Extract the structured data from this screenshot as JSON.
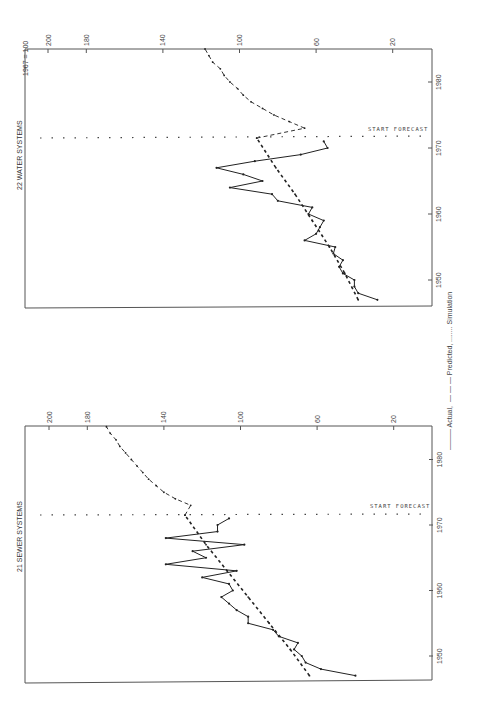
{
  "legend": {
    "actual_label": "——— Actual,",
    "predicted_label": "— — — Predicted,",
    "simulation_label": "........ Simulation"
  },
  "chart_data": [
    {
      "type": "line",
      "title": "22 WATER SYSTEMS",
      "subtitle": "1967 = 100",
      "xlabel": "Year",
      "ylabel": "Index (1967 = 100)",
      "x_ticks": [
        1950,
        1960,
        1970,
        1980
      ],
      "y_ticks": [
        20,
        60,
        100,
        140,
        180,
        200
      ],
      "xlim": [
        1946.5,
        1985
      ],
      "ylim": [
        0,
        210
      ],
      "annotation": "START FORECAST",
      "forecast_start_year": 1971.5,
      "rotation": "rotated 90 degrees counter-clockwise",
      "series": [
        {
          "name": "Actual",
          "style": "solid",
          "x": [
            1947,
            1948,
            1949,
            1950,
            1951,
            1952,
            1953,
            1954,
            1955,
            1956,
            1957,
            1958,
            1959,
            1960,
            1961,
            1962,
            1963,
            1964,
            1965,
            1966,
            1967,
            1968,
            1969,
            1970,
            1971
          ],
          "values": [
            28,
            38,
            40,
            40,
            46,
            48,
            46,
            51,
            50,
            66,
            60,
            58,
            56,
            64,
            62,
            80,
            83,
            105,
            88,
            98,
            112,
            92,
            68,
            54,
            56
          ]
        },
        {
          "name": "Predicted",
          "style": "dashed",
          "x": [
            1947,
            1951,
            1955,
            1959,
            1963,
            1967,
            1971.5
          ],
          "values": [
            38,
            45,
            53,
            62,
            71,
            81,
            91
          ]
        },
        {
          "name": "Simulation",
          "style": "dotted",
          "x": [
            1971.5,
            1973,
            1974,
            1975,
            1976,
            1977,
            1978,
            1979,
            1980,
            1981,
            1982,
            1983,
            1984,
            1985
          ],
          "values": [
            91,
            66,
            74,
            82,
            88,
            94,
            98,
            101,
            105,
            108,
            110,
            114,
            116,
            118
          ]
        }
      ]
    },
    {
      "type": "line",
      "title": "21 SEWER SYSTEMS",
      "subtitle": "",
      "xlabel": "Year",
      "ylabel": "Index (1967 = 100)",
      "x_ticks": [
        1950,
        1960,
        1970,
        1980
      ],
      "y_ticks": [
        20,
        60,
        100,
        140,
        180,
        200
      ],
      "xlim": [
        1946.5,
        1985
      ],
      "ylim": [
        0,
        210
      ],
      "annotation": "START FORECAST",
      "forecast_start_year": 1971.5,
      "rotation": "rotated 90 degrees counter-clockwise",
      "series": [
        {
          "name": "Actual",
          "style": "solid",
          "x": [
            1947,
            1948,
            1949,
            1950,
            1951,
            1952,
            1953,
            1954,
            1955,
            1956,
            1957,
            1958,
            1959,
            1960,
            1961,
            1962,
            1963,
            1964,
            1965,
            1966,
            1967,
            1968,
            1969,
            1970,
            1971
          ],
          "values": [
            40,
            58,
            66,
            68,
            72,
            70,
            80,
            83,
            96,
            96,
            102,
            106,
            110,
            104,
            106,
            120,
            102,
            139,
            118,
            125,
            98,
            139,
            112,
            112,
            106
          ]
        },
        {
          "name": "Predicted",
          "style": "dashed",
          "x": [
            1947,
            1951,
            1955,
            1959,
            1963,
            1967,
            1971.5
          ],
          "values": [
            64,
            74,
            85,
            96,
            107,
            118,
            129
          ]
        },
        {
          "name": "Simulation",
          "style": "dotted",
          "x": [
            1971.5,
            1973,
            1974,
            1975,
            1976,
            1977,
            1978,
            1979,
            1980,
            1981,
            1982,
            1983,
            1984,
            1985
          ],
          "values": [
            129,
            126,
            134,
            140,
            144,
            148,
            151,
            154,
            157,
            160,
            163,
            165,
            168,
            170
          ]
        }
      ]
    }
  ]
}
